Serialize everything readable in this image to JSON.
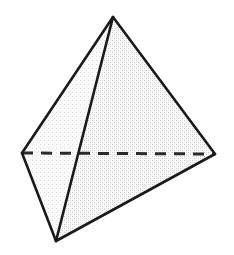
{
  "figure": {
    "name": "tetrahedron",
    "canvas": {
      "width": 234,
      "height": 255,
      "background": "#ffffff"
    },
    "style": {
      "edge_color": "#1a1a1a",
      "edge_width": 2.6,
      "hidden_edge_color": "#2b2b2b",
      "hidden_edge_width": 3.0,
      "hidden_edge_dash": "11,8",
      "face_light": "#ececed",
      "face_mid": "#e2e2e3",
      "face_dark": "#d9d9da",
      "texture_color": "#c9c9cb"
    },
    "vertices": [
      {
        "id": "apex",
        "label": "apex",
        "x": 113,
        "y": 17
      },
      {
        "id": "left",
        "label": "back-left",
        "x": 22,
        "y": 153
      },
      {
        "id": "right",
        "label": "back-right",
        "x": 215,
        "y": 154
      },
      {
        "id": "bottom",
        "label": "front-bottom",
        "x": 56,
        "y": 241
      }
    ],
    "faces": [
      {
        "id": "face-right",
        "label": "right face",
        "vertices": [
          "apex",
          "right",
          "bottom"
        ],
        "fill": "#e2e2e3",
        "visible": true
      },
      {
        "id": "face-left",
        "label": "left face",
        "vertices": [
          "apex",
          "left",
          "bottom"
        ],
        "fill": "#ededee",
        "visible": true
      },
      {
        "id": "face-back",
        "label": "hidden face",
        "vertices": [
          "apex",
          "left",
          "right"
        ],
        "fill": "#e8e8e9",
        "visible": false
      }
    ],
    "edges": [
      {
        "id": "edge-apex-left",
        "label": "apex to back-left",
        "from": "apex",
        "to": "left",
        "hidden": false
      },
      {
        "id": "edge-apex-right",
        "label": "apex to back-right",
        "from": "apex",
        "to": "right",
        "hidden": false
      },
      {
        "id": "edge-apex-bottom",
        "label": "apex to front-bottom",
        "from": "apex",
        "to": "bottom",
        "hidden": false
      },
      {
        "id": "edge-left-bottom",
        "label": "back-left to front-bottom",
        "from": "left",
        "to": "bottom",
        "hidden": false
      },
      {
        "id": "edge-right-bottom",
        "label": "back-right to front-bottom",
        "from": "right",
        "to": "bottom",
        "hidden": false
      },
      {
        "id": "edge-left-right",
        "label": "back-left to back-right",
        "from": "left",
        "to": "right",
        "hidden": true
      }
    ]
  }
}
